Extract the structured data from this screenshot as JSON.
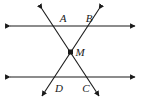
{
  "figure": {
    "background_color": "#ffffff",
    "stroke_color": "#1a1a1a",
    "label_color": "#1a1a1a",
    "width": 145,
    "height": 105
  },
  "labels": {
    "a": "A",
    "b": "B",
    "m": "M",
    "d": "D",
    "c": "C"
  },
  "label_positions": {
    "a": {
      "x": 63,
      "y": 22
    },
    "b": {
      "x": 89,
      "y": 22
    },
    "m": {
      "x": 80,
      "y": 56
    },
    "d": {
      "x": 59,
      "y": 92
    },
    "c": {
      "x": 86,
      "y": 92
    }
  },
  "points": {
    "m": {
      "x": 70.5,
      "y": 52
    }
  },
  "lines": [
    {
      "name": "upper-parallel-line",
      "type": "double-arrow-horizontal",
      "x1": 8,
      "y1": 26,
      "x2": 137,
      "y2": 26
    },
    {
      "name": "lower-parallel-line",
      "type": "double-arrow-horizontal",
      "x1": 8,
      "y1": 77,
      "x2": 137,
      "y2": 77
    },
    {
      "name": "transversal-a-c",
      "type": "double-arrow-diagonal",
      "x1": 40,
      "y1": 7,
      "x2": 101,
      "y2": 98
    },
    {
      "name": "transversal-b-d",
      "type": "double-arrow-diagonal",
      "x1": 101,
      "y1": 7,
      "x2": 40,
      "y2": 98
    }
  ],
  "marker": {
    "name": "point-m-square",
    "shape": "filled-square",
    "size": 5
  }
}
